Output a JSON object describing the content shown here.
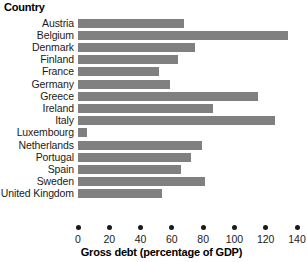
{
  "chart_data": {
    "type": "bar",
    "orientation": "horizontal",
    "title": "",
    "category_axis_header": "Country",
    "xlabel": "Gross debt (percentage of GDP)",
    "ylabel": "Country",
    "xlim": [
      0,
      140
    ],
    "xticks": [
      0,
      20,
      40,
      60,
      80,
      100,
      120,
      140
    ],
    "grid": false,
    "legend": null,
    "bar_color": "#808080",
    "text_color": "#1a1a1a",
    "background_color": "#ffffff",
    "categories": [
      "Austria",
      "Belgium",
      "Denmark",
      "Finland",
      "France",
      "Germany",
      "Greece",
      "Ireland",
      "Italy",
      "Luxembourg",
      "Netherlands",
      "Portugal",
      "Spain",
      "Sweden",
      "United Kingdom"
    ],
    "values": [
      68,
      134,
      75,
      64,
      52,
      59,
      115,
      86,
      126,
      6,
      79,
      72,
      66,
      81,
      54
    ]
  }
}
